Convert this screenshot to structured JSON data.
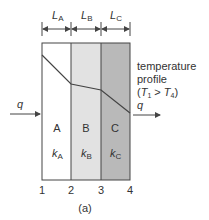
{
  "diagram": {
    "caption": "(a)",
    "colors": {
      "layer_a": "#ffffff",
      "layer_b": "#e2e2e2",
      "layer_c": "#b9b9b9",
      "line": "#444444",
      "text": "#333333"
    },
    "thickness_labels": [
      {
        "symbol": "L",
        "sub": "A"
      },
      {
        "symbol": "L",
        "sub": "B"
      },
      {
        "symbol": "L",
        "sub": "C"
      }
    ],
    "layers": [
      {
        "name": "A",
        "k_symbol": "k",
        "k_sub": "A"
      },
      {
        "name": "B",
        "k_symbol": "k",
        "k_sub": "B"
      },
      {
        "name": "C",
        "k_symbol": "k",
        "k_sub": "C"
      }
    ],
    "interface_labels": [
      "1",
      "2",
      "3",
      "4"
    ],
    "heat_flow": {
      "in_label": "q",
      "out_label": "q"
    },
    "temperature_profile": {
      "line1": "temperature",
      "line2": "profile",
      "condition_open": "(",
      "t_left": "T",
      "t_left_sub": "1",
      "relation": " > ",
      "t_right": "T",
      "t_right_sub": "4",
      "condition_close": ")",
      "points": [
        [
          42,
          55
        ],
        [
          71,
          84
        ],
        [
          101,
          90
        ],
        [
          130,
          113
        ]
      ]
    }
  }
}
